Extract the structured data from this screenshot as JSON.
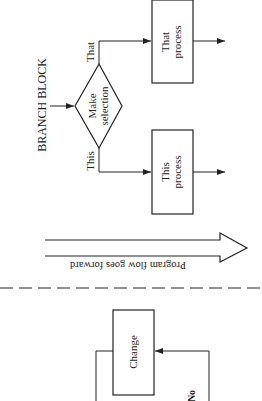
{
  "diagram": {
    "title": "BRANCH BLOCK",
    "decision": {
      "line1": "Make",
      "line2": "selection"
    },
    "branches": [
      {
        "label": "That",
        "process": {
          "line1": "That",
          "line2": "process"
        }
      },
      {
        "label": "This",
        "process": {
          "line1": "This",
          "line2": "process"
        }
      }
    ],
    "flow_arrow": {
      "label": "Program flow goes forward"
    },
    "loop_block": {
      "process": "Change",
      "no_label": "No"
    }
  },
  "colors": {
    "ink": "#222222",
    "background": "#ffffff"
  }
}
